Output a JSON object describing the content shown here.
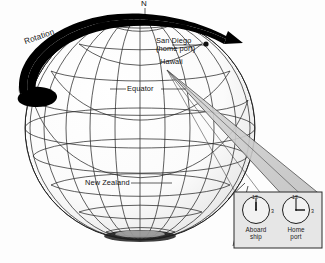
{
  "figure": {
    "background_color": "#fdfdfd",
    "line_color": "#1d1d1d",
    "beam_fill": "#c9c9c9",
    "shadow_fill": "#b5b5b5",
    "arrow_fill": "#000000"
  },
  "globe": {
    "pole_label": "N",
    "equator_label": "Equator",
    "rotation_label": "Rotation",
    "places": [
      {
        "name": "san-diego",
        "line1": "San Diego",
        "line2": "(home port)",
        "has_marker": true
      },
      {
        "name": "hawaii",
        "line1": "Hawaii",
        "line2": "",
        "has_marker": false
      },
      {
        "name": "new-zealand",
        "line1": "New Zealand",
        "line2": "",
        "has_marker": false
      }
    ]
  },
  "inset": {
    "clocks": [
      {
        "id": "aboard-ship",
        "caption_line1": "Aboard",
        "caption_line2": "ship",
        "top_number": "12",
        "right_number": "3",
        "hour_hand_deg": 0,
        "minute_hand_deg": 0,
        "time_reading": "12:00"
      },
      {
        "id": "home-port",
        "caption_line1": "Home",
        "caption_line2": "port",
        "top_number": "12",
        "right_number": "3",
        "hour_hand_deg": 90,
        "minute_hand_deg": 0,
        "time_reading": "3:00"
      }
    ]
  }
}
